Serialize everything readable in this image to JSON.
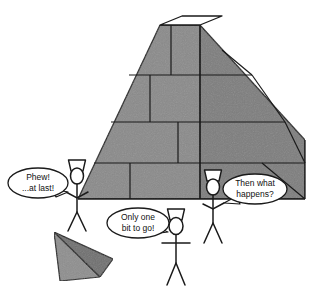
{
  "scene": {
    "title": "Pyramid construction cartoon",
    "background_color": "#ffffff",
    "line_color": "#1a1a1a",
    "stone_color": "#8a8a8a",
    "stone_shadow_color": "#7d7d7d",
    "capstone_light_color": "#8e8e8e",
    "capstone_dark_color": "#6f6f6f",
    "top_platform_color": "#ffffff"
  },
  "structure": {
    "name": "great-pyramid",
    "state_label": "truncated pyramid missing its capstone",
    "courses": 4,
    "top_platform_label": "empty capstone seat"
  },
  "loose_block": {
    "name": "capstone",
    "label": "capstone on the ground"
  },
  "figures": [
    {
      "id": "left-worker",
      "label": "worker at left",
      "headdress": "nemes-headdress"
    },
    {
      "id": "center-worker",
      "label": "worker at center with arms spread",
      "headdress": "nemes-headdress"
    },
    {
      "id": "right-worker",
      "label": "worker at right",
      "headdress": "nemes-headdress"
    }
  ],
  "speech_bubbles": [
    {
      "id": "left-bubble",
      "speaker": "left-worker",
      "lines": [
        "Phew!",
        "...at last!"
      ],
      "tail_direction": "right"
    },
    {
      "id": "center-bubble",
      "speaker": "center-worker",
      "lines": [
        "Only one",
        "bit to go!"
      ],
      "tail_direction": "right"
    },
    {
      "id": "right-bubble",
      "speaker": "right-worker",
      "lines": [
        "Then what",
        "happens?"
      ],
      "tail_direction": "left"
    }
  ]
}
